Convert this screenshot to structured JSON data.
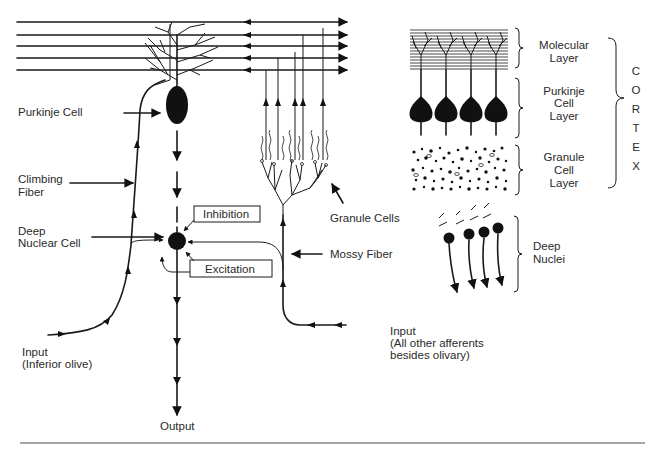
{
  "diagram": {
    "left_circuit": {
      "labels": {
        "purkinje_cell": "Purkinje Cell",
        "climbing_fiber_1": "Climbing",
        "climbing_fiber_2": "Fiber",
        "deep_nuclear_1": "Deep",
        "deep_nuclear_2": "Nuclear Cell",
        "inhibition": "Inhibition",
        "excitation": "Excitation",
        "granule_cells": "Granule Cells",
        "mossy_fiber": "Mossy Fiber",
        "input_olive_1": "Input",
        "input_olive_2": "(Inferior olive)",
        "input_other_1": "Input",
        "input_other_2": "(All other afferents",
        "input_other_3": "besides olivary)",
        "output": "Output"
      }
    },
    "layers_panel": {
      "layers": [
        {
          "line1": "Molecular",
          "line2": "Layer",
          "line3": ""
        },
        {
          "line1": "Purkinje",
          "line2": "Cell",
          "line3": "Layer"
        },
        {
          "line1": "Granule",
          "line2": "Cell",
          "line3": "Layer"
        }
      ],
      "cortex_letters": [
        "C",
        "O",
        "R",
        "T",
        "E",
        "X"
      ],
      "deep_nuclei_1": "Deep",
      "deep_nuclei_2": "Nuclei"
    },
    "colors": {
      "ink": "#1a1a1a",
      "text": "#2a2a2a",
      "rule": "#888888",
      "background": "#ffffff"
    }
  }
}
